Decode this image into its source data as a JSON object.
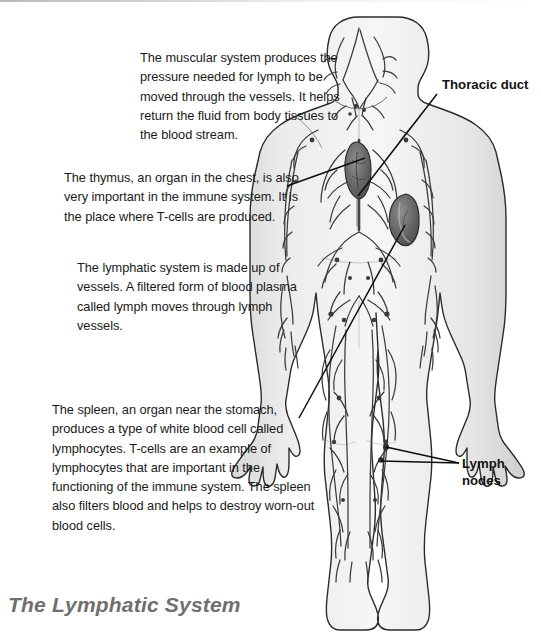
{
  "document": {
    "title": "The Lymphatic System",
    "background_color": "#ffffff",
    "text_color": "#1a1a1a",
    "title_color": "#6f6f6f"
  },
  "annotations": {
    "muscular": "The muscular system produces the pressure needed for lymph to be moved through the vessels. It helps return the fluid from body tissues to the blood stream.",
    "thymus": "The thymus, an organ in the chest, is also very important in the immune system. It is the place where T-cells are produced.",
    "lymphatic": "The lymphatic system is made up of vessels. A filtered form of blood plasma called lymph moves through lymph vessels.",
    "spleen": "The spleen, an organ near the stomach, produces a type of white blood cell called lymphocytes.  T-cells are an example of lymphocytes that are important in the functioning of the immune system. The spleen also filters blood and helps to destroy worn-out blood cells."
  },
  "callouts": {
    "thoracic_duct": "Thoracic duct",
    "lymph_nodes_line1": "Lymph",
    "lymph_nodes_line2": "nodes"
  },
  "figure": {
    "name": "human-lymphatic-system-diagram",
    "view": "posterior full body",
    "skin_fill": "#ededed",
    "outline_color": "#2b2b2b",
    "vessel_color": "#3a3a3a",
    "organ_fill": "#6f6f6f",
    "organs": [
      "thymus",
      "spleen",
      "lymph nodes",
      "thoracic duct"
    ]
  }
}
